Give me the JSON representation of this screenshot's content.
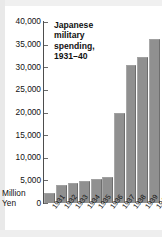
{
  "chart_data": {
    "type": "bar",
    "title": "Japanese\nmilitary\nspending,\n1931–40",
    "title_plain": "Japanese military spending, 1931–40",
    "xlabel": "",
    "ylabel": "Million Yen",
    "categories": [
      "1931",
      "1932",
      "1933",
      "1934",
      "1935",
      "1936",
      "1937",
      "1938",
      "1939",
      "1940"
    ],
    "values": [
      2200,
      3900,
      4500,
      4900,
      5200,
      5700,
      19800,
      30600,
      32300,
      36300
    ],
    "ylim": [
      0,
      40000
    ],
    "ytick_labels": [
      "40,000",
      "35,000",
      "30,000",
      "25,000",
      "20,000",
      "15,000",
      "10,000",
      "5,000",
      "0"
    ],
    "ytick_values": [
      40000,
      35000,
      30000,
      25000,
      20000,
      15000,
      10000,
      5000,
      0
    ],
    "unit_label_line1": "Million",
    "unit_label_line2": "Yen",
    "zero_label": "0",
    "grid": false,
    "legend": "none",
    "bar_color": "#909090",
    "axis_color": "#4d4d4d",
    "text_color": "#111111"
  }
}
